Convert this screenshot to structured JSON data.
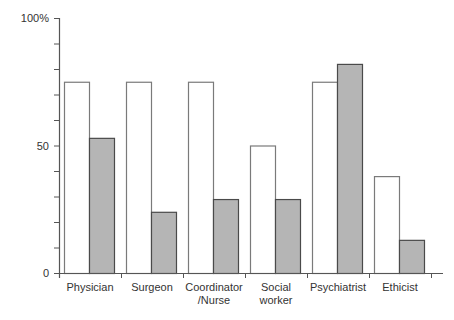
{
  "chart_data": {
    "type": "bar",
    "title": "",
    "xlabel": "",
    "ylabel": "",
    "ylim": [
      0,
      100
    ],
    "y_ticks": [
      {
        "value": 0,
        "label": "0"
      },
      {
        "value": 50,
        "label": "50"
      },
      {
        "value": 100,
        "label": "100%"
      }
    ],
    "y_minor_tick_step": 10,
    "grid": false,
    "legend": null,
    "categories": [
      {
        "lines": [
          "Physician"
        ]
      },
      {
        "lines": [
          "Surgeon"
        ]
      },
      {
        "lines": [
          "Coordinator",
          "/Nurse"
        ]
      },
      {
        "lines": [
          "Social",
          "worker"
        ]
      },
      {
        "lines": [
          "Psychiatrist"
        ]
      },
      {
        "lines": [
          "Ethicist"
        ]
      }
    ],
    "category_names": [
      "Physician",
      "Surgeon",
      "Coordinator /Nurse",
      "Social worker",
      "Psychiatrist",
      "Ethicist"
    ],
    "series": [
      {
        "name": "Series 1 (white)",
        "fill": "#ffffff",
        "stroke": "#7a7a7a",
        "values": [
          75,
          75,
          75,
          50,
          75,
          38
        ]
      },
      {
        "name": "Series 2 (gray)",
        "fill": "#b5b5b5",
        "stroke": "#4a4a4a",
        "values": [
          53,
          24,
          29,
          29,
          82,
          13
        ]
      }
    ]
  },
  "colors": {
    "axis": "#555555",
    "text": "#333333"
  }
}
